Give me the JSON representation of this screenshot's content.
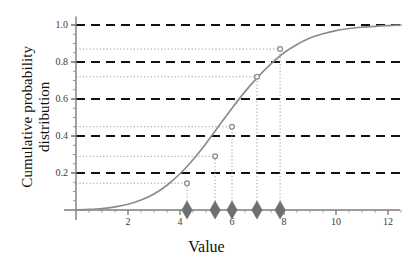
{
  "chart_data": {
    "type": "line",
    "title": "",
    "xlabel": "Value",
    "ylabel": "Cumulative probability distribution",
    "xlim": [
      0,
      12.7
    ],
    "ylim": [
      0,
      1.03
    ],
    "grid": false,
    "legend": null,
    "x_ticks": [
      2,
      4,
      6,
      8,
      10,
      12
    ],
    "x_tick_labels": [
      "2",
      "4",
      "6",
      "8",
      "10",
      "12"
    ],
    "y_ticks": [
      0.2,
      0.4,
      0.6,
      0.8,
      1.0
    ],
    "y_tick_labels": [
      "0.2",
      "0.4",
      "0.6",
      "0.8",
      "1.0"
    ],
    "series": [
      {
        "name": "cumulative-probability-curve",
        "type": "line",
        "color": "#8c8c8c",
        "x": [
          0.0,
          0.5,
          1.0,
          1.5,
          2.0,
          2.5,
          3.0,
          3.5,
          4.0,
          4.5,
          5.0,
          5.5,
          6.0,
          6.5,
          7.0,
          7.5,
          8.0,
          8.5,
          9.0,
          9.5,
          10.0,
          10.5,
          11.0,
          11.5,
          12.0,
          12.5
        ],
        "y": [
          0.0,
          0.003,
          0.008,
          0.017,
          0.031,
          0.054,
          0.087,
          0.134,
          0.196,
          0.272,
          0.36,
          0.455,
          0.55,
          0.64,
          0.72,
          0.79,
          0.85,
          0.895,
          0.93,
          0.953,
          0.97,
          0.981,
          0.988,
          0.993,
          0.997,
          1.0
        ]
      }
    ],
    "reference_lines_major": {
      "style": "dashed",
      "color": "#111111",
      "width": 2.2,
      "values": [
        0.2,
        0.4,
        0.6,
        0.8,
        1.0
      ]
    },
    "reference_lines_minor": {
      "style": "dotted",
      "color": "#9b9b9b",
      "width": 1,
      "values": [
        0.145,
        0.29,
        0.45,
        0.72,
        0.87
      ]
    },
    "markers": {
      "name": "sample-values",
      "shape": "diamond",
      "color": "#6f6f6f",
      "x": [
        4.27,
        5.35,
        6.0,
        6.96,
        7.85
      ],
      "y": [
        0,
        0,
        0,
        0,
        0
      ],
      "labels": [
        "4.27",
        "5.35",
        "6.00",
        "6.96",
        "7.85"
      ]
    },
    "intersections": {
      "name": "curve-intersection-points",
      "shape": "circle",
      "color": "#8c8c8c",
      "x": [
        4.27,
        5.35,
        6.0,
        6.96,
        7.85
      ],
      "y": [
        0.145,
        0.29,
        0.45,
        0.72,
        0.87
      ]
    },
    "annotations": []
  },
  "axes": {
    "x_title": "Value",
    "y_title_line1": "Cumulative probability",
    "y_title_line2": "distribution"
  },
  "colors": {
    "curve": "#8c8c8c",
    "major_dash": "#111111",
    "minor_dot": "#9b9b9b",
    "marker": "#6f6f6f",
    "axis": "#7d7d7d",
    "text": "#111111",
    "background": "#ffffff"
  }
}
